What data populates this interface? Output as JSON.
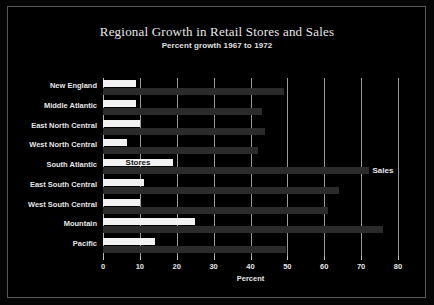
{
  "chart_data": {
    "type": "bar",
    "orientation": "horizontal",
    "title": "Regional Growth in Retail Stores and Sales",
    "subtitle": "Percent growth 1967 to 1972",
    "xlabel": "Percent",
    "ylabel": "",
    "xlim": [
      0,
      80
    ],
    "xticks": [
      0,
      10,
      20,
      30,
      40,
      50,
      60,
      70,
      80
    ],
    "xtick_labels": [
      "0",
      "10",
      "20",
      "30",
      "40",
      "50",
      "60",
      "70",
      "80"
    ],
    "grid": true,
    "legend_position": "inline-annotation",
    "categories": [
      "New England",
      "Middle Atlantic",
      "East North Central",
      "West North Central",
      "South Atlantic",
      "East South Central",
      "West South Central",
      "Mountain",
      "Pacific"
    ],
    "series": [
      {
        "name": "Stores",
        "color": "#f2f2f2",
        "values": [
          9,
          9,
          10,
          6.5,
          19,
          11,
          10,
          25,
          14
        ]
      },
      {
        "name": "Sales",
        "color": "#2b2b2b",
        "values": [
          49,
          43,
          44,
          42,
          72,
          64,
          61,
          76,
          49.5
        ]
      }
    ],
    "annotations": [
      {
        "text": "Stores",
        "series": "Stores",
        "category": "South Atlantic"
      },
      {
        "text": "Sales",
        "series": "Sales",
        "category": "South Atlantic"
      }
    ]
  },
  "figure": {
    "background_color": "#000000",
    "frame_color": "#585858",
    "grid_color": "#9a9a9a",
    "text_color": "#e6e6e6"
  }
}
